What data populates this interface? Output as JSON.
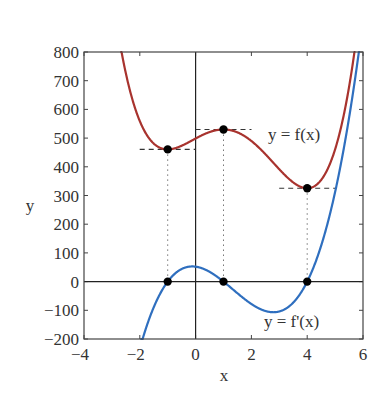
{
  "chart_data": {
    "type": "line",
    "title": "",
    "xlabel": "x",
    "ylabel": "y",
    "xlim": [
      -4,
      6
    ],
    "ylim": [
      -200,
      800
    ],
    "xticks": [
      -4,
      -2,
      0,
      2,
      4,
      6
    ],
    "xtick_labels": [
      "−4",
      "−2",
      "0",
      "2",
      "4",
      "6"
    ],
    "yticks": [
      -200,
      -100,
      0,
      100,
      200,
      300,
      400,
      500,
      600,
      700,
      800
    ],
    "ytick_labels": [
      "−200",
      "−100",
      "0",
      "100",
      "200",
      "300",
      "400",
      "500",
      "600",
      "700",
      "800"
    ],
    "grid": false,
    "legend": "none (inline curve labels)",
    "series": [
      {
        "name": "y = f(x)",
        "color": "#a8332e",
        "x": [
          -2.64,
          -2.5,
          -2,
          -1.5,
          -1,
          -0.5,
          0,
          0.5,
          1,
          1.5,
          2,
          2.5,
          3,
          3.5,
          4,
          4.5,
          5,
          5.5,
          5.75
        ],
        "values": [
          792,
          720,
          559,
          481,
          461,
          472,
          499,
          522,
          530,
          516,
          481,
          433,
          385,
          346,
          325,
          337,
          397,
          527,
          618
        ]
      },
      {
        "name": "y = f'(x)",
        "color": "#2f6fbf",
        "x": [
          -1.8,
          -1.5,
          -1,
          -0.5,
          0,
          0.5,
          1,
          1.5,
          2,
          2.5,
          3,
          3.5,
          4,
          4.5,
          5,
          5.5,
          5.97
        ],
        "values": [
          -200,
          -104,
          0,
          49,
          52,
          24,
          0,
          -41,
          -78,
          -99,
          -104,
          -81,
          0,
          179,
          468,
          890,
          887
        ]
      }
    ],
    "annotations": [
      {
        "text": "y = f(x)",
        "near": [
          4.6,
          480
        ]
      },
      {
        "text": "y = f'(x)",
        "near": [
          4.6,
          -140
        ]
      },
      {
        "type": "critical-point",
        "x": -1,
        "f": 465,
        "fprime": 0
      },
      {
        "type": "critical-point",
        "x": 1,
        "f": 530,
        "fprime": 0
      },
      {
        "type": "critical-point",
        "x": 4,
        "f": 342,
        "fprime": 0
      }
    ],
    "model": {
      "k": 13,
      "C": 498.6,
      "f_roots_of_derivative": [
        -1,
        1,
        4
      ]
    }
  },
  "labels": {
    "xlabel": "x",
    "ylabel": "y",
    "f_label": "y = f(x)",
    "fprime_label": "y = f'(x)"
  }
}
